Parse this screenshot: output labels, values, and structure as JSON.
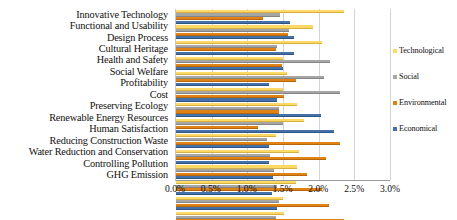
{
  "chart_data": {
    "type": "bar",
    "orientation": "horizontal",
    "title": "",
    "xlabel": "",
    "ylabel": "",
    "xlim": [
      0,
      3.0
    ],
    "xticks": [
      "0.0%",
      "0.5%",
      "1.0%",
      "1.5%",
      "2.0%",
      "2.5%",
      "3.0%"
    ],
    "xtick_values": [
      0.0,
      0.5,
      1.0,
      1.5,
      2.0,
      2.5,
      3.0
    ],
    "grid": true,
    "legend_position": "right",
    "categories": [
      "Innovative Technology",
      "Functional and Usability",
      "Design Process",
      "Cultural Heritage",
      "Health and Safety",
      "Social Welfare",
      "Profitability",
      "Cost",
      "Preserving Ecology",
      "Renewable Energy Resources",
      "Human Satisfaction",
      "Reducing Construction Waste",
      "Water Reduction and Conservation",
      "Controlling Pollution",
      "GHG Emission"
    ],
    "series": [
      {
        "name": "Technological",
        "color": "#ffd966",
        "values": [
          2.35,
          1.92,
          2.05,
          1.5,
          1.55,
          1.5,
          1.7,
          1.8,
          1.4,
          1.72,
          1.7,
          1.68,
          1.5,
          1.52,
          1.72
        ]
      },
      {
        "name": "Social",
        "color": "#a6a6a6",
        "values": [
          1.46,
          1.58,
          1.42,
          2.16,
          2.07,
          2.3,
          1.45,
          1.5,
          1.28,
          1.32,
          1.38,
          1.42,
          1.45,
          1.4,
          1.42
        ]
      },
      {
        "name": "Environmental",
        "color": "#e08214",
        "values": [
          1.22,
          1.57,
          1.4,
          1.48,
          1.68,
          1.52,
          1.45,
          1.15,
          2.3,
          2.1,
          1.84,
          2.05,
          2.15,
          2.35,
          2.5
        ]
      },
      {
        "name": "Economical",
        "color": "#4472a8",
        "values": [
          1.6,
          1.65,
          1.66,
          1.5,
          1.3,
          1.42,
          2.03,
          2.22,
          1.3,
          1.3,
          1.36,
          1.35,
          1.42,
          1.03,
          1.0
        ]
      }
    ]
  }
}
